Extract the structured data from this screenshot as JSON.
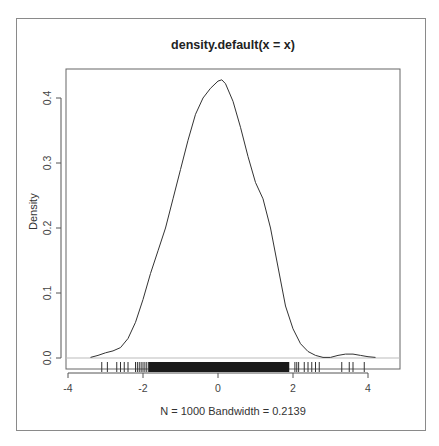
{
  "chart_data": {
    "type": "line",
    "title": "density.default(x = x)",
    "xlabel": "N = 1000   Bandwidth = 0.2139",
    "ylabel": "Density",
    "xlim": [
      -4.4,
      4.9
    ],
    "ylim": [
      -0.016,
      0.445
    ],
    "x_ticks": [
      -4,
      -2,
      0,
      2,
      4
    ],
    "x_tick_labels": [
      "-4",
      "-2",
      "0",
      "2",
      "4"
    ],
    "y_ticks": [
      0.0,
      0.1,
      0.2,
      0.3,
      0.4
    ],
    "y_tick_labels": [
      "0.0",
      "0.1",
      "0.2",
      "0.3",
      "0.4"
    ],
    "grid": false,
    "baseline_y": 0,
    "rug": true,
    "n": 1000,
    "bandwidth": 0.2139,
    "x": [
      -3.4,
      -3.2,
      -3.0,
      -2.8,
      -2.6,
      -2.4,
      -2.2,
      -2.0,
      -1.8,
      -1.6,
      -1.4,
      -1.2,
      -1.0,
      -0.8,
      -0.6,
      -0.4,
      -0.2,
      0.0,
      0.1,
      0.2,
      0.4,
      0.6,
      0.8,
      1.0,
      1.2,
      1.4,
      1.6,
      1.8,
      2.0,
      2.2,
      2.4,
      2.6,
      2.8,
      3.0,
      3.2,
      3.4,
      3.6,
      3.8,
      4.0,
      4.2
    ],
    "y": [
      0.001,
      0.004,
      0.008,
      0.011,
      0.016,
      0.03,
      0.055,
      0.09,
      0.13,
      0.165,
      0.2,
      0.245,
      0.29,
      0.335,
      0.375,
      0.4,
      0.415,
      0.426,
      0.428,
      0.422,
      0.395,
      0.355,
      0.31,
      0.27,
      0.245,
      0.2,
      0.14,
      0.08,
      0.045,
      0.022,
      0.01,
      0.004,
      0.001,
      0.001,
      0.004,
      0.006,
      0.006,
      0.004,
      0.002,
      0.001
    ]
  },
  "rug_ticks": [
    -3.1,
    -2.95,
    -2.7,
    -2.6,
    -2.5,
    -2.4,
    -2.2,
    -2.15,
    -2.1,
    -2.05,
    -2.0,
    -1.95,
    -1.9,
    -1.85,
    2.05,
    2.1,
    2.15,
    2.3,
    2.4,
    2.5,
    2.6,
    2.7,
    3.3,
    3.5,
    3.6,
    3.9
  ],
  "rug_dense_range": [
    -1.85,
    1.9
  ]
}
